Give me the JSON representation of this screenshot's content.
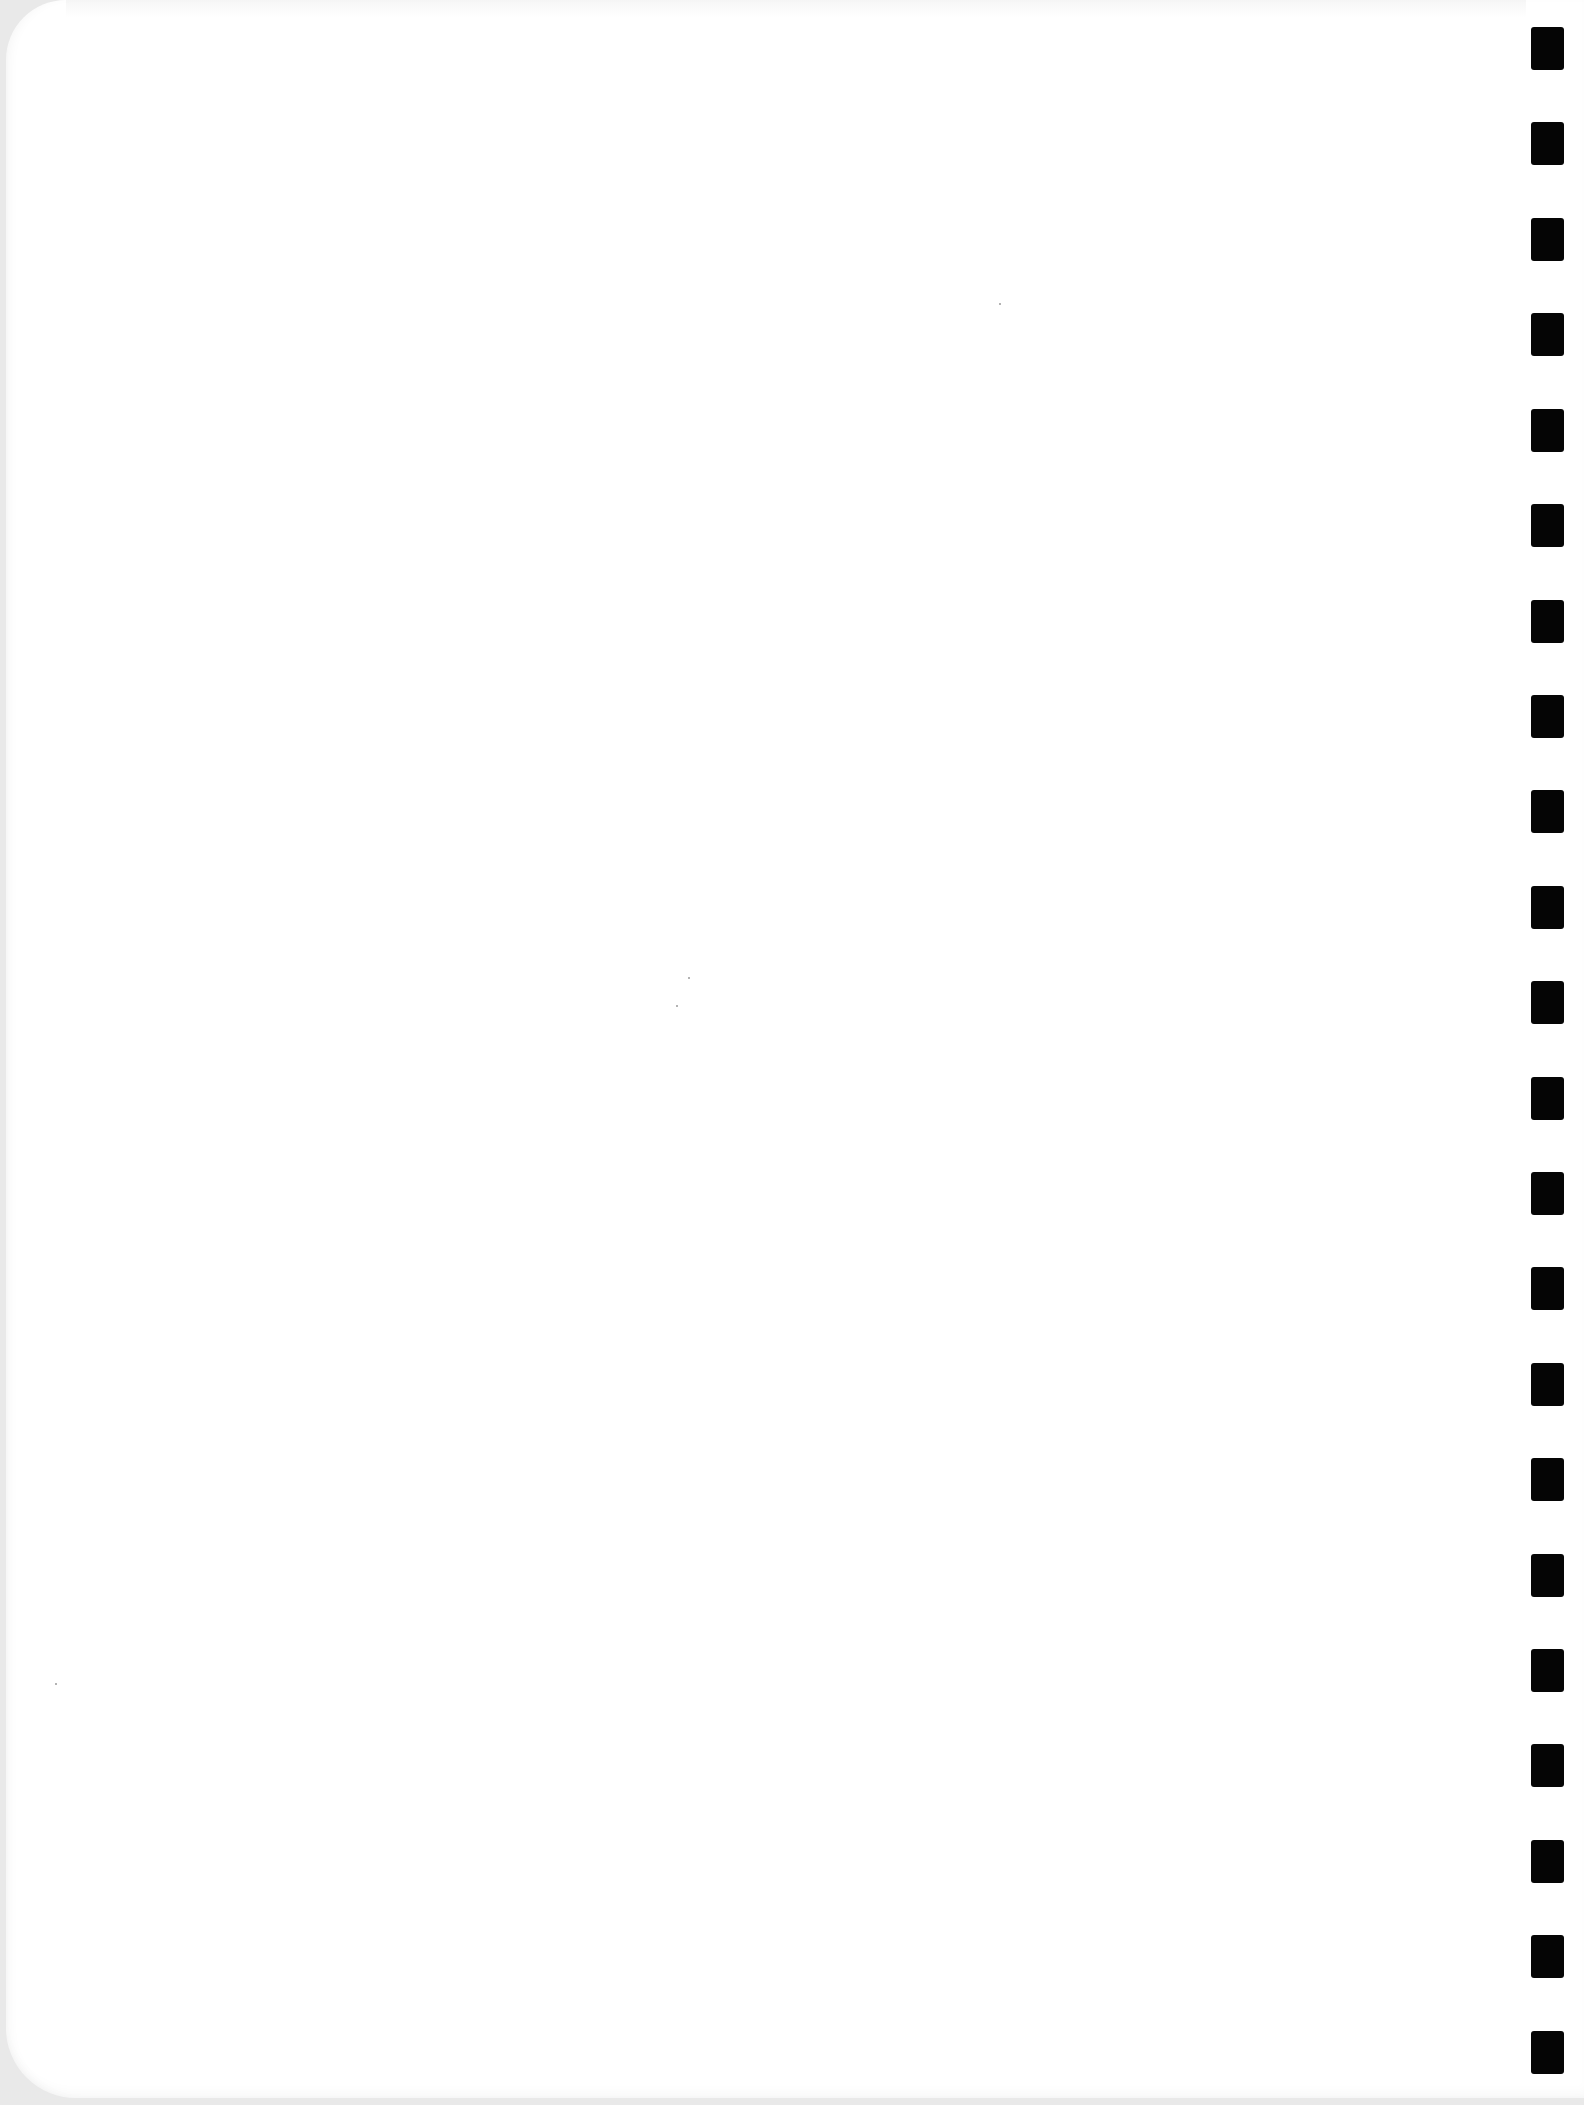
{
  "document": {
    "kind": "scanned blank page",
    "text_content": "",
    "binding": {
      "type": "punched binding holes",
      "side": "right",
      "hole_count": 22,
      "hole_color": "#050505",
      "hole_tops_px": [
        27,
        122,
        218,
        313,
        409,
        504,
        600,
        695,
        790,
        886,
        981,
        1077,
        1172,
        1267,
        1363,
        1458,
        1554,
        1649,
        1744,
        1840,
        1935,
        2031
      ]
    },
    "colors": {
      "page": "#ffffff",
      "scanner_background": "#e9e9e9"
    }
  }
}
